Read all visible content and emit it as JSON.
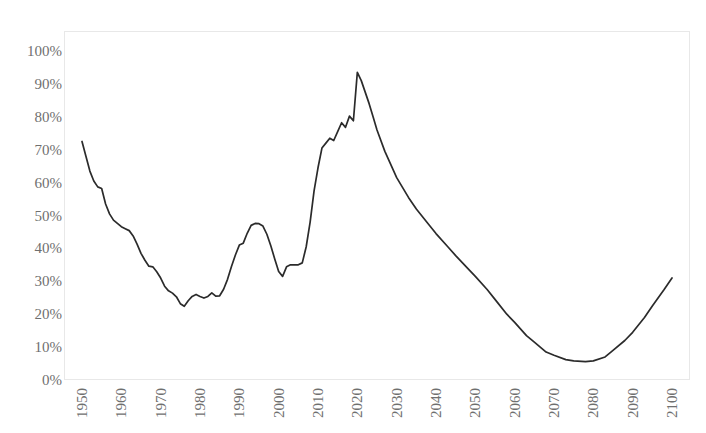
{
  "chart_data": {
    "type": "line",
    "title": "",
    "subtitle": "",
    "xlabel": "",
    "ylabel": "",
    "xlim": [
      1950,
      2100
    ],
    "ylim": [
      0,
      100
    ],
    "grid": false,
    "legend": false,
    "legend_position": "none",
    "value_suffix": "%",
    "line_color": "#2b2b2b",
    "axis_color": "#e8e8e8",
    "tick_label_color": "#6f6f6f",
    "ytick_labels": [
      "100%",
      "90%",
      "80%",
      "70%",
      "60%",
      "50%",
      "40%",
      "30%",
      "20%",
      "10%",
      "0%"
    ],
    "ytick_values": [
      100,
      90,
      80,
      70,
      60,
      50,
      40,
      30,
      20,
      10,
      0
    ],
    "xtick_labels": [
      "1950",
      "1960",
      "1970",
      "1980",
      "1990",
      "2000",
      "2010",
      "2020",
      "2030",
      "2040",
      "2050",
      "2060",
      "2070",
      "2080",
      "2090",
      "2100"
    ],
    "xtick_values": [
      1950,
      1960,
      1970,
      1980,
      1990,
      2000,
      2010,
      2020,
      2030,
      2040,
      2050,
      2060,
      2070,
      2080,
      2090,
      2100
    ],
    "series": [
      {
        "name": "value",
        "x": [
          1950,
          1951,
          1952,
          1953,
          1954,
          1955,
          1956,
          1957,
          1958,
          1959,
          1960,
          1961,
          1962,
          1963,
          1964,
          1965,
          1966,
          1967,
          1968,
          1969,
          1970,
          1971,
          1972,
          1973,
          1974,
          1975,
          1976,
          1977,
          1978,
          1979,
          1980,
          1981,
          1982,
          1983,
          1984,
          1985,
          1986,
          1987,
          1988,
          1989,
          1990,
          1991,
          1992,
          1993,
          1994,
          1995,
          1996,
          1997,
          1998,
          1999,
          2000,
          2001,
          2002,
          2003,
          2004,
          2005,
          2006,
          2007,
          2008,
          2009,
          2010,
          2011,
          2012,
          2013,
          2014,
          2015,
          2016,
          2017,
          2018,
          2019,
          2020,
          2021,
          2022,
          2023,
          2024,
          2025,
          2030,
          2035,
          2040,
          2045,
          2050,
          2055,
          2060,
          2065,
          2070,
          2075,
          2080,
          2085,
          2090,
          2095,
          2100
        ],
        "values": [
          72.5,
          68.0,
          63.5,
          60.5,
          58.5,
          58.0,
          54.0,
          50.5,
          48.5,
          47.5,
          46.5,
          46.0,
          45.5,
          44.0,
          41.5,
          38.5,
          36.5,
          34.5,
          34.5,
          33.0,
          31.0,
          28.5,
          27.0,
          26.5,
          25.5,
          23.5,
          22.5,
          24.0,
          25.5,
          26.0,
          25.5,
          25.0,
          25.5,
          26.5,
          25.5,
          25.5,
          27.5,
          30.5,
          34.5,
          38.0,
          41.0,
          41.5,
          44.5,
          47.0,
          47.5,
          47.5,
          47.0,
          44.5,
          41.0,
          37.0,
          33.0,
          31.5,
          34.5,
          35.0,
          35.0,
          35.0,
          35.5,
          40.5,
          48.0,
          57.5,
          64.5,
          70.5,
          72.0,
          73.5,
          73.0,
          75.5,
          78.0,
          77.0,
          80.0,
          79.0,
          93.5,
          91.0,
          87.5,
          84.0,
          80.0,
          76.0,
          62.0,
          52.0,
          44.5,
          38.0,
          31.5,
          24.5,
          18.0,
          12.5,
          8.5,
          6.0,
          5.5,
          6.0,
          9.0,
          14.5,
          20.5
        ],
        "values_tail_x": [
          2060,
          2065,
          2070,
          2075,
          2080,
          2085,
          2090,
          2095,
          2100
        ],
        "color": "#2b2b2b"
      }
    ]
  },
  "series_points": [
    [
      1950,
      72.5
    ],
    [
      1951,
      68.0
    ],
    [
      1952,
      63.5
    ],
    [
      1953,
      60.5
    ],
    [
      1954,
      58.7
    ],
    [
      1955,
      58.2
    ],
    [
      1956,
      53.5
    ],
    [
      1957,
      50.5
    ],
    [
      1958,
      48.6
    ],
    [
      1959,
      47.6
    ],
    [
      1960,
      46.6
    ],
    [
      1961,
      46.0
    ],
    [
      1962,
      45.4
    ],
    [
      1963,
      43.8
    ],
    [
      1964,
      41.3
    ],
    [
      1965,
      38.5
    ],
    [
      1966,
      36.4
    ],
    [
      1967,
      34.6
    ],
    [
      1968,
      34.4
    ],
    [
      1969,
      32.9
    ],
    [
      1970,
      31.0
    ],
    [
      1971,
      28.5
    ],
    [
      1972,
      27.1
    ],
    [
      1973,
      26.4
    ],
    [
      1974,
      25.3
    ],
    [
      1975,
      23.2
    ],
    [
      1976,
      22.4
    ],
    [
      1977,
      24.1
    ],
    [
      1978,
      25.4
    ],
    [
      1979,
      26.0
    ],
    [
      1980,
      25.4
    ],
    [
      1981,
      24.9
    ],
    [
      1982,
      25.4
    ],
    [
      1983,
      26.5
    ],
    [
      1984,
      25.5
    ],
    [
      1985,
      25.6
    ],
    [
      1986,
      27.6
    ],
    [
      1987,
      30.6
    ],
    [
      1988,
      34.5
    ],
    [
      1989,
      38.0
    ],
    [
      1990,
      41.0
    ],
    [
      1991,
      41.6
    ],
    [
      1992,
      44.6
    ],
    [
      1993,
      47.0
    ],
    [
      1994,
      47.6
    ],
    [
      1995,
      47.5
    ],
    [
      1996,
      46.8
    ],
    [
      1997,
      44.3
    ],
    [
      1998,
      40.8
    ],
    [
      1999,
      36.8
    ],
    [
      2000,
      33.0
    ],
    [
      2001,
      31.5
    ],
    [
      2002,
      34.4
    ],
    [
      2003,
      35.0
    ],
    [
      2004,
      35.0
    ],
    [
      2005,
      35.0
    ],
    [
      2006,
      35.6
    ],
    [
      2007,
      40.5
    ],
    [
      2008,
      48.0
    ],
    [
      2009,
      57.5
    ],
    [
      2010,
      64.5
    ],
    [
      2011,
      70.5
    ],
    [
      2012,
      72.0
    ],
    [
      2013,
      73.5
    ],
    [
      2014,
      72.8
    ],
    [
      2015,
      75.5
    ],
    [
      2016,
      78.2
    ],
    [
      2017,
      76.8
    ],
    [
      2018,
      80.2
    ],
    [
      2019,
      78.8
    ],
    [
      2020,
      93.5
    ],
    [
      2021,
      91.0
    ],
    [
      2022,
      87.5
    ],
    [
      2023,
      84.0
    ],
    [
      2024,
      80.0
    ],
    [
      2025,
      76.0
    ],
    [
      2027,
      69.5
    ],
    [
      2030,
      61.5
    ],
    [
      2033,
      55.5
    ],
    [
      2035,
      52.0
    ],
    [
      2038,
      47.5
    ],
    [
      2040,
      44.5
    ],
    [
      2043,
      40.5
    ],
    [
      2045,
      37.8
    ],
    [
      2048,
      34.0
    ],
    [
      2050,
      31.5
    ],
    [
      2053,
      27.5
    ],
    [
      2055,
      24.5
    ],
    [
      2058,
      20.0
    ],
    [
      2060,
      17.5
    ],
    [
      2063,
      13.5
    ],
    [
      2065,
      11.5
    ],
    [
      2068,
      8.5
    ],
    [
      2070,
      7.5
    ],
    [
      2073,
      6.2
    ],
    [
      2075,
      5.8
    ],
    [
      2078,
      5.6
    ],
    [
      2080,
      5.8
    ],
    [
      2083,
      7.0
    ],
    [
      2085,
      9.0
    ],
    [
      2088,
      12.0
    ],
    [
      2090,
      14.5
    ],
    [
      2093,
      19.0
    ],
    [
      2095,
      22.5
    ],
    [
      2098,
      27.5
    ],
    [
      2100,
      31.0
    ]
  ]
}
